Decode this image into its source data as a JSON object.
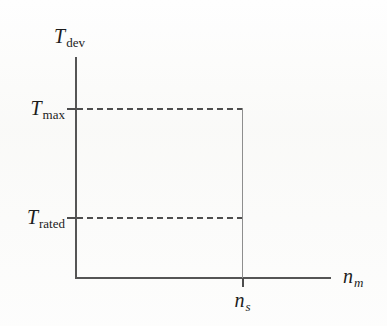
{
  "figure": {
    "kind": "torque-speed-diagram",
    "background_color": "#fefefe",
    "line_color": "#4d4d4d",
    "text_color": "#1c1c1c"
  },
  "axes": {
    "y": {
      "symbol": "T",
      "subscript": "dev",
      "label": "Tdev",
      "style": "solid"
    },
    "x": {
      "symbol": "n",
      "subscript": "m",
      "label": "nm",
      "style": "solid"
    }
  },
  "y_ticks": [
    {
      "symbol": "T",
      "subscript": "max",
      "label": "Tmax"
    },
    {
      "symbol": "T",
      "subscript": "rated",
      "label": "Trated"
    }
  ],
  "x_ticks": [
    {
      "symbol": "n",
      "subscript": "s",
      "label": "ns"
    }
  ],
  "chart_data": {
    "type": "line",
    "title": "",
    "xlabel": "n_m",
    "ylabel": "T_dev",
    "xlim": [
      0,
      1.3
    ],
    "ylim": [
      0,
      1.15
    ],
    "grid": false,
    "legend": "none",
    "x_tick_labels": [
      "n_s"
    ],
    "x_tick_values": [
      1.0
    ],
    "y_tick_labels": [
      "T_rated",
      "T_max"
    ],
    "y_tick_values": [
      0.36,
      1.0
    ],
    "series": [
      {
        "name": "T_max locus",
        "style": "dashed",
        "x": [
          0,
          1.0
        ],
        "y": [
          1.0,
          1.0
        ]
      },
      {
        "name": "T_rated locus",
        "style": "dashed",
        "x": [
          0,
          1.0
        ],
        "y": [
          0.36,
          0.36
        ]
      },
      {
        "name": "synchronous speed n_s",
        "style": "solid",
        "x": [
          1.0,
          1.0
        ],
        "y": [
          0,
          1.0
        ]
      }
    ],
    "annotations": []
  }
}
